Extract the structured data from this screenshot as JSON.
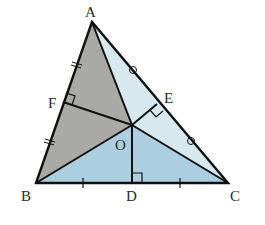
{
  "diagram": {
    "points": {
      "A": {
        "label": "A",
        "x": 92,
        "y": 22
      },
      "B": {
        "label": "B",
        "x": 36,
        "y": 183
      },
      "C": {
        "label": "C",
        "x": 228,
        "y": 183
      },
      "O": {
        "label": "O",
        "x": 132,
        "y": 125
      },
      "D": {
        "label": "D",
        "x": 132,
        "y": 183
      },
      "E": {
        "label": "E",
        "x": 157,
        "y": 104
      },
      "F": {
        "label": "F",
        "x": 63,
        "y": 102
      }
    },
    "colors": {
      "gray_region": "#a9a9a5",
      "light_blue_region": "#d7e9ef",
      "blue_region": "#abcee0",
      "stroke": "#111111",
      "label": "#2a2a2a"
    },
    "labels": {
      "A": "A",
      "B": "B",
      "C": "C",
      "D": "D",
      "E": "E",
      "F": "F",
      "O": "O"
    },
    "markings": {
      "AF_FB": "double-tick",
      "AE_EC": "circle",
      "BD_DC": "single-tick",
      "right_angles": [
        "F",
        "E",
        "D"
      ]
    }
  }
}
